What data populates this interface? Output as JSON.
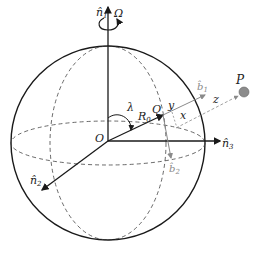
{
  "diagram": {
    "type": "sphere-coordinate-frame",
    "labels": {
      "n1": "n̂",
      "n1_sub": "1",
      "omega": "Ω",
      "n2": "n̂",
      "n2_sub": "2",
      "n3": "n̂",
      "n3_sub": "3",
      "origin": "O",
      "lambda": "λ",
      "r0": "R",
      "r0_sub": "0",
      "q": "Q",
      "y": "y",
      "x": "x",
      "z": "z",
      "b1": "b̂",
      "b1_sub": "1",
      "b2": "b̂",
      "b2_sub": "2",
      "p": "P"
    },
    "colors": {
      "ink": "#1a1a1a",
      "grey": "#8a8a8a",
      "point_fill": "#8c8c8c"
    }
  }
}
